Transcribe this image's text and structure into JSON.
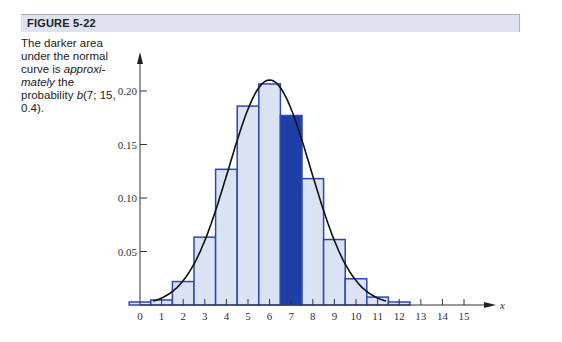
{
  "figure": {
    "label": "FIGURE 5-22",
    "caption_parts": {
      "p1": "The darker area under the normal curve is ",
      "p2": "approxi-mately",
      "p3": " the probability ",
      "p4": "b",
      "p5": "(7; 15, 0.4)."
    }
  },
  "colors": {
    "bar_fill": "#d9e3f3",
    "bar_stroke": "#2c48b0",
    "highlight_fill": "#1f3fa8",
    "curve": "#111111",
    "header_bg": "#dfe3ef"
  },
  "chart_data": {
    "type": "bar",
    "title": "",
    "xlabel": "x",
    "ylabel": "",
    "categories": [
      "0",
      "1",
      "2",
      "3",
      "4",
      "5",
      "6",
      "7",
      "8",
      "9",
      "10",
      "11",
      "12",
      "13",
      "14",
      "15"
    ],
    "values": [
      0.0005,
      0.0047,
      0.0219,
      0.0634,
      0.1268,
      0.1859,
      0.2066,
      0.1771,
      0.1181,
      0.0612,
      0.0245,
      0.0074,
      0.0016,
      0.0003,
      0.0,
      0.0
    ],
    "highlighted_category": "7",
    "overlay_curve": {
      "type": "normal",
      "mean": 6,
      "sd": 1.897
    },
    "y_ticks": [
      "0.05",
      "0.10",
      "0.15",
      "0.20"
    ],
    "x_ticks": [
      "0",
      "1",
      "2",
      "3",
      "4",
      "5",
      "6",
      "7",
      "8",
      "9",
      "10",
      "11",
      "12",
      "13",
      "14",
      "15"
    ],
    "ylim": [
      0,
      0.22
    ],
    "xlim": [
      0,
      16
    ],
    "grid": false,
    "legend": null
  }
}
